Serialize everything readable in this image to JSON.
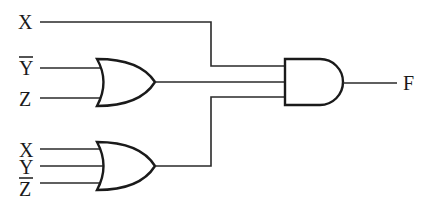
{
  "diagram": {
    "type": "logic-circuit",
    "inputs": {
      "top_x": "X",
      "or1_in1": "Y",
      "or1_in1_negated": true,
      "or1_in2": "Z",
      "or2_in1": "X",
      "or2_in2": "Y",
      "or2_in3": "Z",
      "or2_in3_negated": true
    },
    "gates": [
      {
        "id": "or1",
        "type": "OR",
        "inputs": [
          "Y'",
          "Z"
        ]
      },
      {
        "id": "or2",
        "type": "OR",
        "inputs": [
          "X",
          "Y",
          "Z'"
        ]
      },
      {
        "id": "and1",
        "type": "AND",
        "inputs": [
          "X",
          "or1",
          "or2"
        ]
      }
    ],
    "output": "F",
    "colors": {
      "line": "#1a1a1a",
      "background": "#ffffff"
    }
  }
}
